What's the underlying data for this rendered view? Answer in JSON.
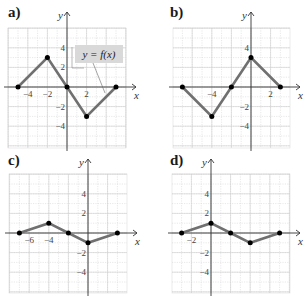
{
  "chart_data": [
    {
      "type": "line",
      "label": "a)",
      "title": "y = f(x)",
      "annotation": "y = f(x)",
      "xlabel": "x",
      "ylabel": "y",
      "x_ticks": [
        "-4",
        "-2",
        "2"
      ],
      "y_ticks": [
        "4",
        "2",
        "-2",
        "-4"
      ],
      "xlim": [
        -6,
        6
      ],
      "ylim": [
        -6,
        6
      ],
      "grid": true,
      "points": [
        [
          -5,
          0
        ],
        [
          -2,
          3
        ],
        [
          0,
          0
        ],
        [
          2,
          -3
        ],
        [
          5,
          0
        ]
      ]
    },
    {
      "type": "line",
      "label": "b)",
      "xlabel": "x",
      "ylabel": "y",
      "x_ticks": [
        "-4",
        "2"
      ],
      "y_ticks": [
        "4",
        "-2",
        "-4"
      ],
      "xlim": [
        -8,
        4
      ],
      "ylim": [
        -6,
        6
      ],
      "grid": true,
      "points": [
        [
          -7,
          0
        ],
        [
          -4,
          -3
        ],
        [
          -2,
          0
        ],
        [
          0,
          3
        ],
        [
          3,
          0
        ]
      ]
    },
    {
      "type": "line",
      "label": "c)",
      "xlabel": "x",
      "ylabel": "y",
      "x_ticks": [
        "-6",
        "-4"
      ],
      "y_ticks": [
        "4",
        "2",
        "-2",
        "-4"
      ],
      "xlim": [
        -8,
        4
      ],
      "ylim": [
        -6,
        6
      ],
      "grid": true,
      "points": [
        [
          -7,
          0
        ],
        [
          -4,
          1
        ],
        [
          -2,
          0
        ],
        [
          0,
          -1
        ],
        [
          3,
          0
        ]
      ]
    },
    {
      "type": "line",
      "label": "d)",
      "xlabel": "x",
      "ylabel": "y",
      "x_ticks": [
        "-2"
      ],
      "y_ticks": [
        "4",
        "2",
        "-2",
        "-4"
      ],
      "xlim": [
        -4,
        8
      ],
      "ylim": [
        -6,
        6
      ],
      "grid": true,
      "points": [
        [
          -3,
          0
        ],
        [
          0,
          1
        ],
        [
          2,
          0
        ],
        [
          4,
          -1
        ],
        [
          7,
          0
        ]
      ]
    }
  ],
  "panels": {
    "a": {
      "label": "a)"
    },
    "b": {
      "label": "b)"
    },
    "c": {
      "label": "c)"
    },
    "d": {
      "label": "d)"
    }
  }
}
